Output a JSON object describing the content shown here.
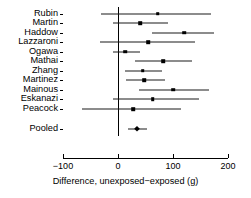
{
  "chart_data": {
    "type": "scatter",
    "subtype": "forest-plot",
    "title": "",
    "xlabel": "Difference, unexposed−exposed (g)",
    "ylabel": "",
    "xlim": [
      -100,
      200
    ],
    "xticks": [
      -100,
      0,
      100,
      200
    ],
    "xticklabels": [
      "−100",
      "0",
      "100",
      "200"
    ],
    "grid": false,
    "legend": null,
    "null_line_value": 0,
    "categories": [
      "Rubin",
      "Martin",
      "Haddow",
      "Lazzaroni",
      "Ogawa",
      "Mathai",
      "Zhang",
      "Martinez",
      "Mainous",
      "Eskanazi",
      "Peacock",
      "Pooled"
    ],
    "rows": [
      {
        "label": "Rubin",
        "estimate": 72,
        "ci_low": -31,
        "ci_high": 170,
        "is_pooled": false
      },
      {
        "label": "Martin",
        "estimate": 40,
        "ci_low": -10,
        "ci_high": 90,
        "is_pooled": false
      },
      {
        "label": "Haddow",
        "estimate": 120,
        "ci_low": 62,
        "ci_high": 175,
        "is_pooled": false
      },
      {
        "label": "Lazzaroni",
        "estimate": 55,
        "ci_low": -32,
        "ci_high": 140,
        "is_pooled": false
      },
      {
        "label": "Ogawa",
        "estimate": 13,
        "ci_low": -9,
        "ci_high": 40,
        "is_pooled": false
      },
      {
        "label": "Mathai",
        "estimate": 82,
        "ci_low": 30,
        "ci_high": 135,
        "is_pooled": false
      },
      {
        "label": "Zhang",
        "estimate": 45,
        "ci_low": 12,
        "ci_high": 80,
        "is_pooled": false
      },
      {
        "label": "Martinez",
        "estimate": 48,
        "ci_low": 15,
        "ci_high": 85,
        "is_pooled": false
      },
      {
        "label": "Mainous",
        "estimate": 100,
        "ci_low": 38,
        "ci_high": 165,
        "is_pooled": false
      },
      {
        "label": "Eskanazi",
        "estimate": 63,
        "ci_low": -10,
        "ci_high": 148,
        "is_pooled": false
      },
      {
        "label": "Peacock",
        "estimate": 28,
        "ci_low": -65,
        "ci_high": 115,
        "is_pooled": false
      },
      {
        "label": "Pooled",
        "estimate": 35,
        "ci_low": 18,
        "ci_high": 53,
        "is_pooled": true
      }
    ],
    "colors": {
      "marker": "#000000",
      "ci_line": "#1a1a1a",
      "axis": "#000000",
      "background": "#ffffff"
    }
  }
}
